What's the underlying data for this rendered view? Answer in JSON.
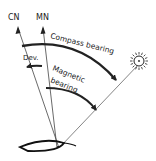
{
  "diagram": {
    "type": "compass bearing diagram",
    "labels": {
      "compass_north": "CN",
      "magnetic_north": "MN",
      "compass_bearing": "Compass bearing",
      "deviation": "Dev.",
      "magnetic_bearing_line1": "Magnetic",
      "magnetic_bearing_line2": "bearing"
    },
    "icons": {
      "target": "sun-icon",
      "vessel": "boat-hull-icon"
    },
    "colors": {
      "line": "#222222",
      "thin_line": "#555555",
      "background": "#ffffff"
    }
  }
}
